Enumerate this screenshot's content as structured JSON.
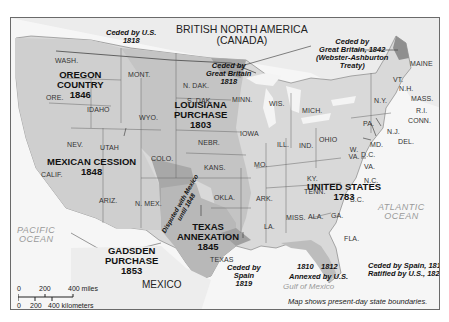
{
  "title": {
    "line1": "BRITISH NORTH AMERICA",
    "line2": "(CANADA)"
  },
  "regions": {
    "oregon": {
      "line1": "OREGON",
      "line2": "COUNTRY",
      "year": "1846"
    },
    "louisiana": {
      "line1": "LOUISIANA",
      "line2": "PURCHASE",
      "year": "1803"
    },
    "mexican_cession": {
      "line1": "MEXICAN CESSION",
      "year": "1848"
    },
    "texas": {
      "line1": "TEXAS",
      "line2": "ANNEXATION",
      "year": "1845"
    },
    "gadsden": {
      "line1": "GADSDEN",
      "line2": "PURCHASE",
      "year": "1853"
    },
    "united_states": {
      "line1": "UNITED STATES",
      "year": "1783"
    }
  },
  "annotations": {
    "ceded_by_us_1818": {
      "line1": "Ceded by U.S.",
      "line2": "1818"
    },
    "ceded_by_gb_1818": {
      "line1": "Ceded by",
      "line2": "Great Britain",
      "line3": "1818"
    },
    "ceded_by_gb_1842": {
      "line1": "Ceded by",
      "line2": "Great Britain, 1842",
      "line3": "(Webster-Ashburton",
      "line4": "Treaty)"
    },
    "disputed_mexico": {
      "line1": "Disputed with Mexico",
      "line2": "until 1848"
    },
    "ceded_by_spain_1819": {
      "line1": "Ceded by",
      "line2": "Spain",
      "line3": "1819"
    },
    "annexed_1810": "1810",
    "annexed_1812": "1812",
    "annexed_by_us": "Annexed by U.S.",
    "florida": {
      "line1": "Ceded by Spain, 1819",
      "line2": "Ratified by U.S., 1821"
    }
  },
  "states": {
    "wash": "WASH.",
    "ore": "ORE.",
    "idaho": "IDAHO",
    "mont": "MONT.",
    "wyo": "WYO.",
    "nev": "NEV.",
    "utah": "UTAH",
    "calif": "CALIF.",
    "colo": "COLO.",
    "ariz": "ARIZ.",
    "nmex": "N. MEX.",
    "ndak": "N. DAK.",
    "sdak": "S. DAK.",
    "nebr": "NEBR.",
    "kans": "KANS.",
    "okla": "OKLA.",
    "texas": "TEXAS",
    "minn": "MINN.",
    "iowa": "IOWA",
    "mo": "MO.",
    "ark": "ARK.",
    "la": "LA.",
    "wis": "WIS.",
    "ill": "ILL.",
    "mich": "MICH.",
    "ind": "IND.",
    "ohio": "OHIO",
    "ky": "KY.",
    "tenn": "TENN.",
    "miss": "MISS.",
    "ala": "ALA.",
    "ga": "GA.",
    "fla": "FLA.",
    "sc": "S.C.",
    "nc": "N.C.",
    "va": "VA.",
    "wva": "W. VA.",
    "dc": "D.C.",
    "md": "MD.",
    "del": "DEL.",
    "nj": "N.J.",
    "pa": "PA.",
    "ny": "N.Y.",
    "conn": "CONN.",
    "ri": "R.I.",
    "mass": "MASS.",
    "vt": "VT.",
    "nh": "N.H.",
    "maine": "MAINE"
  },
  "oceans": {
    "pacific": {
      "line1": "PACIFIC",
      "line2": "OCEAN"
    },
    "atlantic": {
      "line1": "ATLANTIC",
      "line2": "OCEAN"
    },
    "gulf": "Gulf of Mexico"
  },
  "country_mexico": "MEXICO",
  "scale": {
    "miles": [
      "0",
      "200",
      "400 miles"
    ],
    "km": [
      "0",
      "200",
      "400 kilometers"
    ]
  },
  "footnote": "Map shows present-day state boundaries.",
  "colors": {
    "frame": "#6a6a6a",
    "land_light": "#e6e6e6",
    "land_mid": "#c8c8c8",
    "land_dark": "#9c9c9c",
    "water": "#f7f7f7",
    "border": "#555555"
  }
}
